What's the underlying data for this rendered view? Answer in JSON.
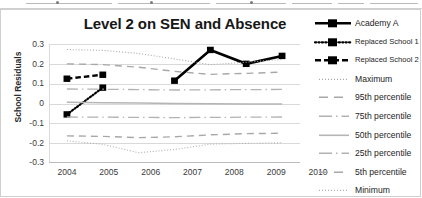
{
  "chart_data": {
    "type": "line",
    "title": "Level 2 on SEN and Absence",
    "xlabel": "",
    "ylabel": "School Residuals",
    "x": [
      2004,
      2005,
      2006,
      2007,
      2008,
      2009,
      2010
    ],
    "xticklabels": [
      "2004",
      "2005",
      "2006",
      "2007",
      "2008",
      "2009",
      "2010"
    ],
    "yticklabels": [
      "0.3",
      "0.2",
      "0.1",
      "0",
      "-0.1",
      "-0.2",
      "-0.3"
    ],
    "yticks": [
      0.3,
      0.2,
      0.1,
      0,
      -0.1,
      -0.2,
      -0.3
    ],
    "ylim": [
      -0.3,
      0.3
    ],
    "grid": true,
    "legend_position": "right",
    "series": [
      {
        "name": "Academy A",
        "style": "solid-thick-marker",
        "color": "#000000",
        "x": [
          2007,
          2008,
          2009,
          2010
        ],
        "values": [
          0.115,
          0.27,
          0.2,
          0.24
        ]
      },
      {
        "name": "Replaced School 1",
        "style": "dotted-marker",
        "color": "#000000",
        "x": [
          2004,
          2005
        ],
        "values": [
          -0.055,
          0.08
        ]
      },
      {
        "name": "Replaced School 2",
        "style": "dashed-marker",
        "color": "#000000",
        "x": [
          2004,
          2005
        ],
        "values": [
          0.125,
          0.145
        ]
      },
      {
        "name": "Maximum",
        "style": "fine-dotted",
        "color": "#a8a8a8",
        "x": [
          2004,
          2005,
          2006,
          2007,
          2008,
          2009,
          2010
        ],
        "values": [
          0.272,
          0.268,
          0.252,
          0.225,
          0.196,
          0.208,
          0.222
        ]
      },
      {
        "name": "95th percentile",
        "style": "dashed",
        "color": "#a8a8a8",
        "x": [
          2004,
          2005,
          2006,
          2007,
          2008,
          2009,
          2010
        ],
        "values": [
          0.2,
          0.196,
          0.183,
          0.162,
          0.147,
          0.152,
          0.158
        ]
      },
      {
        "name": "75th percentile",
        "style": "dash-dot",
        "color": "#b2b2b2",
        "x": [
          2004,
          2005,
          2006,
          2007,
          2008,
          2009,
          2010
        ],
        "values": [
          0.073,
          0.072,
          0.07,
          0.068,
          0.069,
          0.07,
          0.071
        ]
      },
      {
        "name": "50th percentile",
        "style": "solid",
        "color": "#b5b5b5",
        "x": [
          2004,
          2005,
          2006,
          2007,
          2008,
          2009,
          2010
        ],
        "values": [
          0.006,
          0.004,
          0.002,
          0.0,
          -0.001,
          -0.002,
          -0.003
        ]
      },
      {
        "name": "25th percentile",
        "style": "dash-dot",
        "color": "#b2b2b2",
        "x": [
          2004,
          2005,
          2006,
          2007,
          2008,
          2009,
          2010
        ],
        "values": [
          -0.068,
          -0.069,
          -0.07,
          -0.071,
          -0.07,
          -0.069,
          -0.068
        ]
      },
      {
        "name": "5th percentile",
        "style": "dashed",
        "color": "#a8a8a8",
        "x": [
          2004,
          2005,
          2006,
          2007,
          2008,
          2009,
          2010
        ],
        "values": [
          -0.163,
          -0.166,
          -0.172,
          -0.168,
          -0.158,
          -0.152,
          -0.15
        ]
      },
      {
        "name": "Minimum",
        "style": "fine-dotted",
        "color": "#b0b0b0",
        "x": [
          2004,
          2005,
          2006,
          2007,
          2008,
          2009,
          2010
        ],
        "values": [
          -0.188,
          -0.206,
          -0.248,
          -0.232,
          -0.205,
          -0.201,
          -0.198
        ]
      }
    ]
  },
  "legend": {
    "entries": [
      {
        "label": "Academy A"
      },
      {
        "label": "Replaced School 1"
      },
      {
        "label": "Replaced School 2"
      },
      {
        "label": "Maximum"
      },
      {
        "label": "95th percentile"
      },
      {
        "label": "75th percentile"
      },
      {
        "label": "50th percentile"
      },
      {
        "label": "25th  percentile"
      },
      {
        "label": "5th percentile"
      },
      {
        "label": "Minimum"
      }
    ]
  }
}
